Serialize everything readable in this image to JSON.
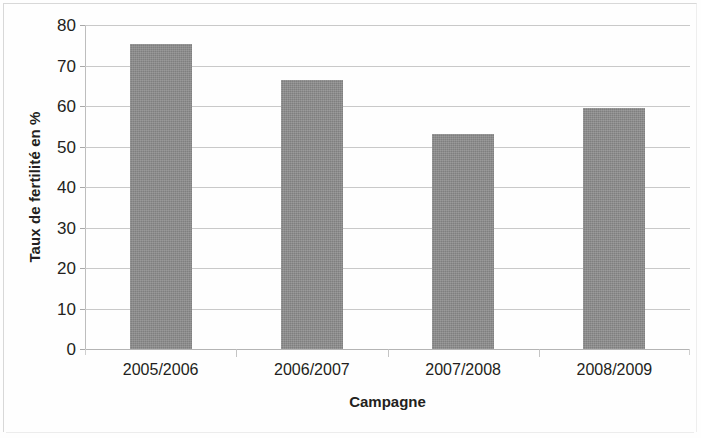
{
  "chart_data": {
    "type": "bar",
    "title": "",
    "subtitle": "",
    "categories": [
      "2005/2006",
      "2006/2007",
      "2007/2008",
      "2008/2009"
    ],
    "values": [
      75.2,
      66.4,
      53.2,
      59.6
    ],
    "xlabel": "Campagne",
    "ylabel": "Taux de fertilité en %",
    "ylim": [
      0,
      80
    ],
    "ytick_step": 10,
    "yticks": [
      0,
      10,
      20,
      30,
      40,
      50,
      60,
      70,
      80
    ],
    "ytick_labels": [
      "0",
      "10",
      "20",
      "30",
      "40",
      "50",
      "60",
      "70",
      "80"
    ],
    "grid": "horizontal",
    "legend": "none",
    "series": [
      {
        "name": "Taux de fertilité en %",
        "values": [
          75.2,
          66.4,
          53.2,
          59.6
        ],
        "color": "#8c8c8c"
      }
    ],
    "annotations": []
  },
  "colors": {
    "bar_fill": "#8c8c8c",
    "gridline": "#c9c9c9",
    "axis_line": "#bdbdbd",
    "text": "#231f20",
    "page_background": "#fefefe",
    "frame": "#d8d8d8"
  }
}
